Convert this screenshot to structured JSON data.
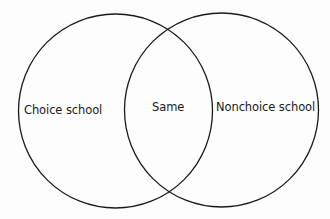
{
  "diagram": {
    "type": "venn",
    "sets": [
      {
        "id": "left",
        "label": "Choice school"
      },
      {
        "id": "right",
        "label": "Nonchoice school"
      }
    ],
    "intersection": {
      "label": "Same"
    },
    "colors": {
      "background": "#fdfdfd",
      "stroke": "#1a1a1a",
      "text": "#1a1a1a"
    }
  }
}
